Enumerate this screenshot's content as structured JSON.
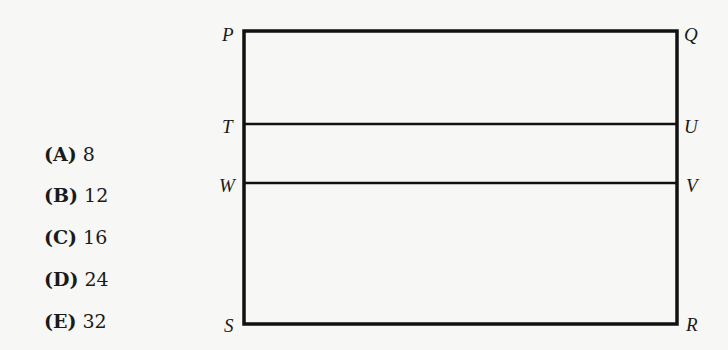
{
  "figure": {
    "type": "rectangle-diagram",
    "vertices": {
      "P": "P",
      "Q": "Q",
      "R": "R",
      "S": "S",
      "T": "T",
      "U": "U",
      "V": "V",
      "W": "W"
    },
    "segments": [
      "PQ",
      "QR",
      "RS",
      "SP",
      "TU",
      "WV"
    ],
    "line_color": "#111111"
  },
  "choices": [
    {
      "letter": "(A)",
      "value": "8"
    },
    {
      "letter": "(B)",
      "value": "12"
    },
    {
      "letter": "(C)",
      "value": "16"
    },
    {
      "letter": "(D)",
      "value": "24"
    },
    {
      "letter": "(E)",
      "value": "32"
    }
  ]
}
